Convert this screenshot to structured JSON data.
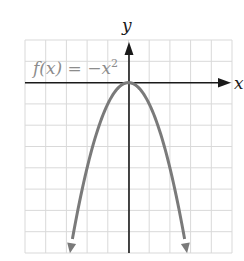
{
  "chart_data": {
    "type": "line",
    "title": "",
    "function_label": "f(x) = −x²",
    "function_label_parts": {
      "f": "f(x) = −x",
      "exp": "2"
    },
    "xlabel": "x",
    "ylabel": "y",
    "xlim": [
      -5,
      5
    ],
    "ylim": [
      -8,
      2
    ],
    "grid": true,
    "grid_step": 1,
    "legend": null,
    "series": [
      {
        "name": "f(x) = -x^2",
        "expression": "-x^2",
        "domain": [
          -2.83,
          2.83
        ],
        "arrows_at_ends": true,
        "x": [
          -2.83,
          -2,
          -1,
          0,
          1,
          2,
          2.83
        ],
        "y": [
          -8,
          -4,
          -1,
          0,
          -1,
          -4,
          -8
        ]
      }
    ],
    "colors": {
      "curve": "#7a7a7a",
      "label": "#8c8c8c",
      "axis": "#1a1a1a",
      "grid": "#d9d9d9"
    }
  }
}
